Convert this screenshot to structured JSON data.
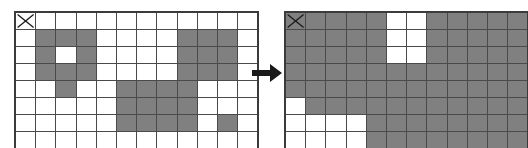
{
  "figure": {
    "arrow_label": "transforms to",
    "colors": {
      "filled_cell": "#808080",
      "empty_cell": "#ffffff",
      "grid_line": "#4a4a4a",
      "border": "#3b3b3b",
      "arrow": "#1a1a1a",
      "x_mark": "#1a1a1a"
    },
    "cell_size": {
      "width": 19.2,
      "height": 16
    }
  },
  "grids": [
    {
      "name": "before-grid",
      "label": "Before",
      "columns": 12,
      "rows": 8,
      "start_marker": {
        "row": 0,
        "col": 0,
        "icon": "x-mark-icon"
      },
      "cells": [
        [
          0,
          0,
          0,
          0,
          0,
          0,
          0,
          0,
          0,
          0,
          0,
          0
        ],
        [
          0,
          1,
          1,
          1,
          0,
          0,
          0,
          0,
          1,
          1,
          1,
          0
        ],
        [
          0,
          1,
          0,
          1,
          0,
          0,
          0,
          0,
          1,
          1,
          1,
          0
        ],
        [
          0,
          1,
          1,
          1,
          0,
          0,
          0,
          0,
          1,
          1,
          1,
          0
        ],
        [
          0,
          0,
          1,
          0,
          0,
          1,
          1,
          1,
          1,
          0,
          0,
          0
        ],
        [
          0,
          0,
          0,
          0,
          0,
          1,
          1,
          1,
          1,
          0,
          0,
          0
        ],
        [
          0,
          0,
          0,
          0,
          0,
          1,
          1,
          1,
          1,
          0,
          1,
          0
        ],
        [
          0,
          0,
          0,
          0,
          0,
          0,
          0,
          0,
          0,
          0,
          0,
          0
        ]
      ]
    },
    {
      "name": "after-grid",
      "label": "After",
      "columns": 12,
      "rows": 8,
      "start_marker": {
        "row": 0,
        "col": 0,
        "icon": "x-mark-icon"
      },
      "cells": [
        [
          1,
          1,
          1,
          1,
          1,
          0,
          0,
          1,
          1,
          1,
          1,
          1
        ],
        [
          1,
          1,
          1,
          1,
          1,
          0,
          0,
          1,
          1,
          1,
          1,
          1
        ],
        [
          1,
          1,
          1,
          1,
          1,
          0,
          0,
          1,
          1,
          1,
          1,
          1
        ],
        [
          1,
          1,
          1,
          1,
          1,
          1,
          1,
          1,
          1,
          1,
          1,
          1
        ],
        [
          1,
          1,
          1,
          1,
          1,
          1,
          1,
          1,
          1,
          1,
          1,
          1
        ],
        [
          0,
          1,
          1,
          1,
          1,
          1,
          1,
          1,
          1,
          1,
          1,
          1
        ],
        [
          0,
          0,
          0,
          0,
          1,
          1,
          1,
          1,
          1,
          1,
          1,
          1
        ],
        [
          0,
          0,
          0,
          0,
          1,
          1,
          1,
          1,
          1,
          1,
          1,
          1
        ]
      ]
    }
  ]
}
